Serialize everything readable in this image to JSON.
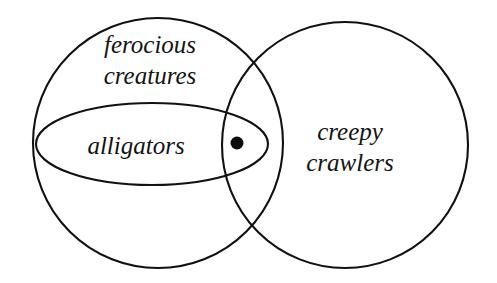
{
  "diagram": {
    "type": "venn-diagram",
    "title": "",
    "background_color": "#ffffff",
    "stroke_color": "#111111",
    "text_color": "#141414",
    "stroke_width": 2.1,
    "labels": {
      "ferocious_creatures_line1": "ferocious",
      "ferocious_creatures_line2": "creatures",
      "alligators": "alligators",
      "creepy_crawlers_line1": "creepy",
      "creepy_crawlers_line2": "crawlers"
    },
    "sets": [
      {
        "name": "ferocious creatures",
        "shape": "circle",
        "cx": 158,
        "cy": 143,
        "r": 125,
        "label_x": 150,
        "label_y_line1": 53,
        "label_y_line2": 84
      },
      {
        "name": "creepy crawlers",
        "shape": "circle",
        "cx": 345,
        "cy": 145,
        "r": 123,
        "label_x": 350,
        "label_y_line1": 140,
        "label_y_line2": 171
      },
      {
        "name": "alligators",
        "shape": "ellipse",
        "cx": 152,
        "cy": 144,
        "rx": 116,
        "ry": 41,
        "label_x": 136,
        "label_y": 154
      }
    ],
    "elements": [
      {
        "name": "member-point",
        "shape": "dot",
        "cx": 237,
        "cy": 143,
        "r": 6.5,
        "regions": [
          "ferocious creatures",
          "creepy crawlers",
          "alligators"
        ]
      }
    ]
  }
}
